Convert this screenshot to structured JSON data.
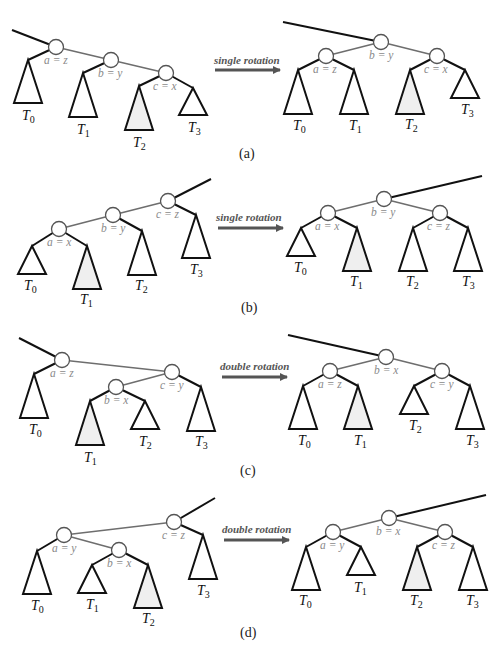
{
  "figure": {
    "panels": [
      {
        "id": "a",
        "caption": "(a)",
        "operation": "single rotation",
        "before": {
          "parent_edge": [
            [
              12,
              30
            ],
            [
              56,
              47
            ]
          ],
          "nodes": [
            {
              "id": "a",
              "label": "a = z",
              "x": 56,
              "y": 47,
              "lx": 44,
              "ly": 64
            },
            {
              "id": "b",
              "label": "b = y",
              "x": 111,
              "y": 60,
              "lx": 98,
              "ly": 77
            },
            {
              "id": "c",
              "label": "c = x",
              "x": 166,
              "y": 73,
              "lx": 153,
              "ly": 90
            }
          ],
          "edges": [
            [
              "a",
              "b"
            ],
            [
              "b",
              "c"
            ]
          ],
          "subtrees": [
            {
              "name": "T",
              "sub": "0",
              "parent": "a",
              "apex": [
                28,
                60
              ],
              "w": 28,
              "h": 43,
              "shaded": false,
              "lx": 22,
              "ly": 120
            },
            {
              "name": "T",
              "sub": "1",
              "parent": "b",
              "apex": [
                83,
                73
              ],
              "w": 28,
              "h": 44,
              "shaded": false,
              "lx": 77,
              "ly": 134
            },
            {
              "name": "T",
              "sub": "2",
              "parent": "c",
              "apex": [
                139,
                86
              ],
              "w": 28,
              "h": 44,
              "shaded": true,
              "lx": 133,
              "ly": 147
            },
            {
              "name": "T",
              "sub": "3",
              "parent": "c",
              "apex": [
                193,
                88
              ],
              "w": 28,
              "h": 27,
              "shaded": false,
              "lx": 188,
              "ly": 132
            }
          ]
        },
        "arrow": {
          "x1": 215,
          "y1": 70,
          "x2": 280,
          "y2": 70,
          "lx": 214,
          "ly": 64
        },
        "after": {
          "parent_edge": [
            [
              283,
              22
            ],
            [
              381,
              42
            ]
          ],
          "nodes": [
            {
              "id": "b",
              "label": "b = y",
              "x": 381,
              "y": 42,
              "lx": 369,
              "ly": 59
            },
            {
              "id": "a",
              "label": "a = z",
              "x": 326,
              "y": 56,
              "lx": 313,
              "ly": 73
            },
            {
              "id": "c",
              "label": "c = x",
              "x": 437,
              "y": 56,
              "lx": 424,
              "ly": 73
            }
          ],
          "edges": [
            [
              "b",
              "a"
            ],
            [
              "b",
              "c"
            ]
          ],
          "subtrees": [
            {
              "name": "T",
              "sub": "0",
              "parent": "a",
              "apex": [
                298,
                70
              ],
              "w": 28,
              "h": 44,
              "shaded": false,
              "lx": 293,
              "ly": 130
            },
            {
              "name": "T",
              "sub": "1",
              "parent": "a",
              "apex": [
                354,
                70
              ],
              "w": 28,
              "h": 44,
              "shaded": false,
              "lx": 349,
              "ly": 130
            },
            {
              "name": "T",
              "sub": "2",
              "parent": "c",
              "apex": [
                410,
                70
              ],
              "w": 28,
              "h": 44,
              "shaded": true,
              "lx": 405,
              "ly": 129
            },
            {
              "name": "T",
              "sub": "3",
              "parent": "c",
              "apex": [
                465,
                70
              ],
              "w": 28,
              "h": 28,
              "shaded": false,
              "lx": 461,
              "ly": 114
            }
          ]
        },
        "caption_pos": {
          "x": 239,
          "y": 158
        }
      },
      {
        "id": "b",
        "caption": "(b)",
        "operation": "single rotation",
        "before": {
          "parent_edge": [
            [
              211,
              179
            ],
            [
              168,
              201
            ]
          ],
          "nodes": [
            {
              "id": "c",
              "label": "c = z",
              "x": 168,
              "y": 201,
              "lx": 156,
              "ly": 218
            },
            {
              "id": "b",
              "label": "b = y",
              "x": 113,
              "y": 215,
              "lx": 101,
              "ly": 232
            },
            {
              "id": "a",
              "label": "a = x",
              "x": 59,
              "y": 229,
              "lx": 47,
              "ly": 246
            }
          ],
          "edges": [
            [
              "c",
              "b"
            ],
            [
              "b",
              "a"
            ]
          ],
          "subtrees": [
            {
              "name": "T",
              "sub": "0",
              "parent": "a",
              "apex": [
                32,
                246
              ],
              "w": 28,
              "h": 28,
              "shaded": false,
              "lx": 24,
              "ly": 290
            },
            {
              "name": "T",
              "sub": "1",
              "parent": "a",
              "apex": [
                87,
                246
              ],
              "w": 28,
              "h": 43,
              "shaded": true,
              "lx": 80,
              "ly": 304
            },
            {
              "name": "T",
              "sub": "2",
              "parent": "b",
              "apex": [
                142,
                231
              ],
              "w": 28,
              "h": 44,
              "shaded": false,
              "lx": 135,
              "ly": 290
            },
            {
              "name": "T",
              "sub": "3",
              "parent": "c",
              "apex": [
                196,
                215
              ],
              "w": 28,
              "h": 43,
              "shaded": false,
              "lx": 190,
              "ly": 274
            }
          ]
        },
        "arrow": {
          "x1": 218,
          "y1": 228,
          "x2": 283,
          "y2": 228,
          "lx": 216,
          "ly": 221
        },
        "after": {
          "parent_edge": [
            [
              482,
              176
            ],
            [
              384,
              199
            ]
          ],
          "nodes": [
            {
              "id": "b",
              "label": "b = y",
              "x": 384,
              "y": 199,
              "lx": 371,
              "ly": 216
            },
            {
              "id": "a",
              "label": "a = x",
              "x": 328,
              "y": 213,
              "lx": 315,
              "ly": 230
            },
            {
              "id": "c",
              "label": "c = z",
              "x": 440,
              "y": 213,
              "lx": 427,
              "ly": 230
            }
          ],
          "edges": [
            [
              "b",
              "a"
            ],
            [
              "b",
              "c"
            ]
          ],
          "subtrees": [
            {
              "name": "T",
              "sub": "0",
              "parent": "a",
              "apex": [
                301,
                228
              ],
              "w": 28,
              "h": 28,
              "shaded": false,
              "lx": 294,
              "ly": 272
            },
            {
              "name": "T",
              "sub": "1",
              "parent": "a",
              "apex": [
                357,
                228
              ],
              "w": 28,
              "h": 43,
              "shaded": true,
              "lx": 350,
              "ly": 286
            },
            {
              "name": "T",
              "sub": "2",
              "parent": "c",
              "apex": [
                413,
                228
              ],
              "w": 28,
              "h": 43,
              "shaded": false,
              "lx": 406,
              "ly": 286
            },
            {
              "name": "T",
              "sub": "3",
              "parent": "c",
              "apex": [
                468,
                228
              ],
              "w": 28,
              "h": 43,
              "shaded": false,
              "lx": 462,
              "ly": 286
            }
          ]
        },
        "caption_pos": {
          "x": 241,
          "y": 312
        }
      },
      {
        "id": "c",
        "caption": "(c)",
        "operation": "double rotation",
        "before": {
          "parent_edge": [
            [
              19,
              338
            ],
            [
              62,
              360
            ]
          ],
          "nodes": [
            {
              "id": "a",
              "label": "a = z",
              "x": 62,
              "y": 360,
              "lx": 50,
              "ly": 377
            },
            {
              "id": "c",
              "label": "c = y",
              "x": 172,
              "y": 372,
              "lx": 160,
              "ly": 389
            },
            {
              "id": "b",
              "label": "b = x",
              "x": 116,
              "y": 387,
              "lx": 104,
              "ly": 404
            }
          ],
          "edges": [
            [
              "a",
              "c"
            ],
            [
              "c",
              "b"
            ]
          ],
          "subtrees": [
            {
              "name": "T",
              "sub": "0",
              "parent": "a",
              "apex": [
                34,
                374
              ],
              "w": 28,
              "h": 44,
              "shaded": false,
              "lx": 29,
              "ly": 434
            },
            {
              "name": "T",
              "sub": "1",
              "parent": "b",
              "apex": [
                90,
                401
              ],
              "w": 28,
              "h": 44,
              "shaded": true,
              "lx": 84,
              "ly": 462
            },
            {
              "name": "T",
              "sub": "2",
              "parent": "b",
              "apex": [
                145,
                401
              ],
              "w": 28,
              "h": 28,
              "shaded": false,
              "lx": 139,
              "ly": 446
            },
            {
              "name": "T",
              "sub": "3",
              "parent": "c",
              "apex": [
                201,
                387
              ],
              "w": 28,
              "h": 44,
              "shaded": false,
              "lx": 195,
              "ly": 446
            }
          ]
        },
        "arrow": {
          "x1": 222,
          "y1": 377,
          "x2": 287,
          "y2": 377,
          "lx": 220,
          "ly": 370
        },
        "after": {
          "parent_edge": [
            [
              288,
              335
            ],
            [
              386,
              357
            ]
          ],
          "nodes": [
            {
              "id": "b",
              "label": "b = x",
              "x": 386,
              "y": 357,
              "lx": 374,
              "ly": 374
            },
            {
              "id": "a",
              "label": "a = z",
              "x": 330,
              "y": 371,
              "lx": 318,
              "ly": 388
            },
            {
              "id": "c",
              "label": "c = y",
              "x": 442,
              "y": 371,
              "lx": 430,
              "ly": 388
            }
          ],
          "edges": [
            [
              "b",
              "a"
            ],
            [
              "b",
              "c"
            ]
          ],
          "subtrees": [
            {
              "name": "T",
              "sub": "0",
              "parent": "a",
              "apex": [
                303,
                386
              ],
              "w": 28,
              "h": 43,
              "shaded": false,
              "lx": 298,
              "ly": 445
            },
            {
              "name": "T",
              "sub": "1",
              "parent": "a",
              "apex": [
                358,
                386
              ],
              "w": 28,
              "h": 43,
              "shaded": true,
              "lx": 354,
              "ly": 445
            },
            {
              "name": "T",
              "sub": "2",
              "parent": "c",
              "apex": [
                414,
                386
              ],
              "w": 28,
              "h": 28,
              "shaded": false,
              "lx": 409,
              "ly": 430
            },
            {
              "name": "T",
              "sub": "3",
              "parent": "c",
              "apex": [
                470,
                386
              ],
              "w": 28,
              "h": 43,
              "shaded": false,
              "lx": 466,
              "ly": 445
            }
          ]
        },
        "caption_pos": {
          "x": 240,
          "y": 475
        }
      },
      {
        "id": "d",
        "caption": "(d)",
        "operation": "double rotation",
        "before": {
          "parent_edge": [
            [
              215,
              498
            ],
            [
              174,
              522
            ]
          ],
          "nodes": [
            {
              "id": "c",
              "label": "c = z",
              "x": 174,
              "y": 522,
              "lx": 162,
              "ly": 539
            },
            {
              "id": "a",
              "label": "a = y",
              "x": 64,
              "y": 535,
              "lx": 52,
              "ly": 552
            },
            {
              "id": "b",
              "label": "b = x",
              "x": 119,
              "y": 550,
              "lx": 107,
              "ly": 567
            }
          ],
          "edges": [
            [
              "c",
              "a"
            ],
            [
              "a",
              "b"
            ]
          ],
          "subtrees": [
            {
              "name": "T",
              "sub": "0",
              "parent": "a",
              "apex": [
                37,
                551
              ],
              "w": 28,
              "h": 43,
              "shaded": false,
              "lx": 31,
              "ly": 610
            },
            {
              "name": "T",
              "sub": "1",
              "parent": "b",
              "apex": [
                92,
                565
              ],
              "w": 28,
              "h": 28,
              "shaded": false,
              "lx": 86,
              "ly": 609
            },
            {
              "name": "T",
              "sub": "2",
              "parent": "b",
              "apex": [
                148,
                565
              ],
              "w": 28,
              "h": 43,
              "shaded": true,
              "lx": 142,
              "ly": 623
            },
            {
              "name": "T",
              "sub": "3",
              "parent": "c",
              "apex": [
                203,
                535
              ],
              "w": 28,
              "h": 44,
              "shaded": false,
              "lx": 197,
              "ly": 595
            }
          ]
        },
        "arrow": {
          "x1": 224,
          "y1": 540,
          "x2": 289,
          "y2": 540,
          "lx": 222,
          "ly": 533
        },
        "after": {
          "parent_edge": [
            [
              486,
              495
            ],
            [
              389,
              518
            ]
          ],
          "nodes": [
            {
              "id": "b",
              "label": "b = x",
              "x": 389,
              "y": 518,
              "lx": 376,
              "ly": 535
            },
            {
              "id": "a",
              "label": "a = y",
              "x": 333,
              "y": 532,
              "lx": 320,
              "ly": 549
            },
            {
              "id": "c",
              "label": "c = z",
              "x": 445,
              "y": 532,
              "lx": 432,
              "ly": 549
            }
          ],
          "edges": [
            [
              "b",
              "a"
            ],
            [
              "b",
              "c"
            ]
          ],
          "subtrees": [
            {
              "name": "T",
              "sub": "0",
              "parent": "a",
              "apex": [
                306,
                547
              ],
              "w": 28,
              "h": 43,
              "shaded": false,
              "lx": 299,
              "ly": 605
            },
            {
              "name": "T",
              "sub": "1",
              "parent": "a",
              "apex": [
                361,
                547
              ],
              "w": 28,
              "h": 28,
              "shaded": false,
              "lx": 354,
              "ly": 592
            },
            {
              "name": "T",
              "sub": "2",
              "parent": "c",
              "apex": [
                417,
                547
              ],
              "w": 28,
              "h": 43,
              "shaded": true,
              "lx": 410,
              "ly": 605
            },
            {
              "name": "T",
              "sub": "3",
              "parent": "c",
              "apex": [
                473,
                547
              ],
              "w": 28,
              "h": 43,
              "shaded": false,
              "lx": 466,
              "ly": 605
            }
          ]
        },
        "caption_pos": {
          "x": 240,
          "y": 637
        }
      }
    ],
    "colors": {
      "node_stroke": "#555555",
      "gray_edge": "#6e6e6e",
      "black_edge": "#111111",
      "shaded_fill": "#efefef",
      "node_label": "#8a8a8a",
      "arrow": "#555555"
    }
  }
}
